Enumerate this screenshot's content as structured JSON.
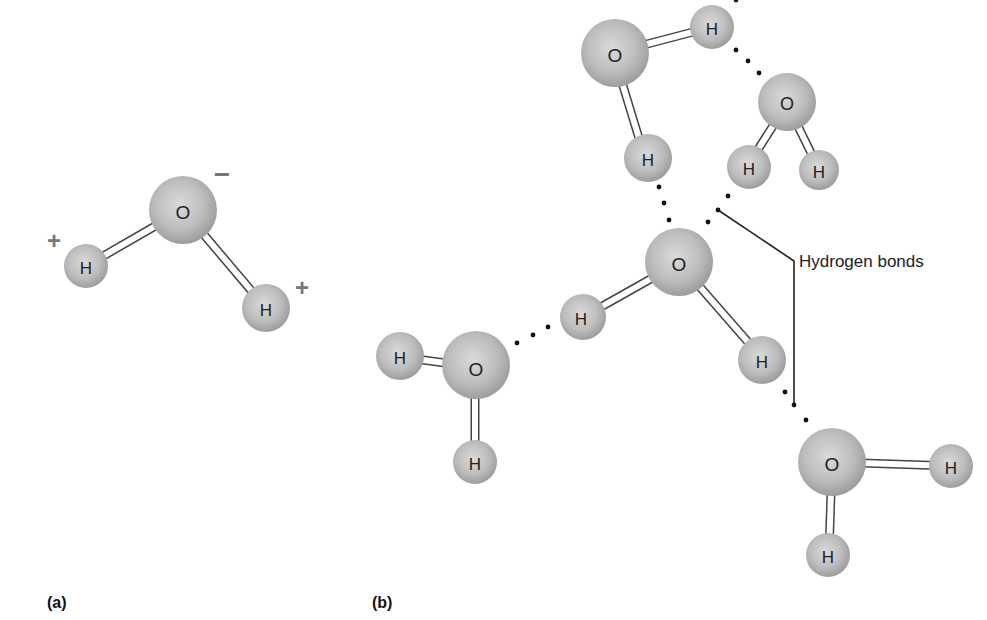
{
  "figure": {
    "panels": [
      {
        "id": "a",
        "label": "(a)"
      },
      {
        "id": "b",
        "label": "(b)"
      }
    ],
    "callout": {
      "text": "Hydrogen bonds"
    },
    "atoms": {
      "oxygen": "O",
      "hydrogen": "H"
    },
    "charges": {
      "negative": "−",
      "positive": "+"
    },
    "colors": {
      "atom_fill": "#b8b8b8",
      "atom_highlight": "#dcdcdc",
      "bond_fill": "#ffffff",
      "bond_stroke": "#444444",
      "hbond_dots": "#111111",
      "charge": "#777777"
    }
  }
}
